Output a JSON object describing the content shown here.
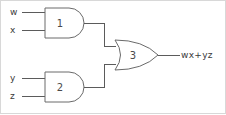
{
  "figure": {
    "kind": "logic-circuit-diagram",
    "title": "",
    "background_color": "#ffffff",
    "line_color": "#5b5b5b",
    "text_color": "#3a3a3a",
    "frame_color": "#d8d8d8"
  },
  "inputs": [
    {
      "id": "w",
      "label": "w",
      "x": 10,
      "y": 15,
      "wire_y": 12,
      "wire_x1": 22,
      "wire_x2": 45
    },
    {
      "id": "x",
      "label": "x",
      "x": 10,
      "y": 33,
      "wire_y": 30,
      "wire_x1": 22,
      "wire_x2": 45
    },
    {
      "id": "y",
      "label": "y",
      "x": 10,
      "y": 81,
      "wire_y": 78,
      "wire_x1": 22,
      "wire_x2": 45
    },
    {
      "id": "z",
      "label": "z",
      "x": 10,
      "y": 99,
      "wire_y": 96,
      "wire_x1": 22,
      "wire_x2": 45
    }
  ],
  "gates": [
    {
      "id": "gate-1",
      "number": "1",
      "type": "AND",
      "inputs": [
        "w",
        "x"
      ],
      "label_x": 60,
      "label_y": 27
    },
    {
      "id": "gate-2",
      "number": "2",
      "type": "AND",
      "inputs": [
        "y",
        "z"
      ],
      "label_x": 60,
      "label_y": 91
    },
    {
      "id": "gate-3",
      "number": "3",
      "type": "OR",
      "inputs": [
        "gate-1",
        "gate-2"
      ],
      "label_x": 133,
      "label_y": 59
    }
  ],
  "output": {
    "id": "circuit-output",
    "expression": "wx+yz",
    "label_x": 180,
    "label_y": 58
  }
}
